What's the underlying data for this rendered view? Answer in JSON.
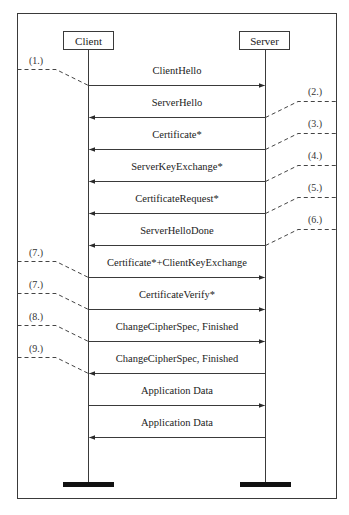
{
  "diagram": {
    "type": "sequence",
    "colors": {
      "line": "#3a3a3a",
      "dashed": "#444444",
      "bar": "#111111",
      "background": "#ffffff"
    },
    "actors": {
      "client": {
        "label": "Client",
        "x": 88
      },
      "server": {
        "label": "Server",
        "x": 265
      }
    },
    "messages": [
      {
        "label": "ClientHello",
        "direction": "client-to-server",
        "y": 85
      },
      {
        "label": "ServerHello",
        "direction": "server-to-client",
        "y": 117
      },
      {
        "label": "Certificate*",
        "direction": "server-to-client",
        "y": 149
      },
      {
        "label": "ServerKeyExchange*",
        "direction": "server-to-client",
        "y": 181
      },
      {
        "label": "CertificateRequest*",
        "direction": "server-to-client",
        "y": 213
      },
      {
        "label": "ServerHelloDone",
        "direction": "server-to-client",
        "y": 245
      },
      {
        "label": "Certificate*+ClientKeyExchange",
        "direction": "client-to-server",
        "y": 277
      },
      {
        "label": "CertificateVerify*",
        "direction": "client-to-server",
        "y": 309
      },
      {
        "label": "ChangeCipherSpec, Finished",
        "direction": "client-to-server",
        "y": 341
      },
      {
        "label": "ChangeCipherSpec, Finished",
        "direction": "server-to-client",
        "y": 373
      },
      {
        "label": "Application Data",
        "direction": "client-to-server",
        "y": 405
      },
      {
        "label": "Application Data",
        "direction": "server-to-client",
        "y": 437
      }
    ],
    "step_annotations": [
      {
        "label": "(1.)",
        "side": "left",
        "message_index": 0
      },
      {
        "label": "(2.)",
        "side": "right",
        "message_index": 1
      },
      {
        "label": "(3.)",
        "side": "right",
        "message_index": 2
      },
      {
        "label": "(4.)",
        "side": "right",
        "message_index": 3
      },
      {
        "label": "(5.)",
        "side": "right",
        "message_index": 4
      },
      {
        "label": "(6.)",
        "side": "right",
        "message_index": 5
      },
      {
        "label": "(7.)",
        "side": "left",
        "message_index": 6
      },
      {
        "label": "(7.)",
        "side": "left",
        "message_index": 7
      },
      {
        "label": "(8.)",
        "side": "left",
        "message_index": 8
      },
      {
        "label": "(9.)",
        "side": "left",
        "message_index": 9
      }
    ]
  }
}
